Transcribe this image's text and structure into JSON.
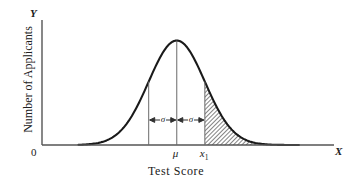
{
  "chart_data": {
    "type": "area",
    "title": "",
    "xlabel": "Test Score",
    "ylabel": "Number of Applicants",
    "x_axis_letter": "X",
    "y_axis_letter": "Y",
    "origin_label": "0",
    "grid": false,
    "legend": null,
    "distribution": "normal",
    "mu_label": "μ",
    "x1_label": "x",
    "x1_subscript": "1",
    "sigma_label": "σ",
    "annotations": [
      {
        "text": "σ",
        "from": "μ-σ",
        "to": "μ",
        "style": "double-headed-arrow"
      },
      {
        "text": "σ",
        "from": "μ",
        "to": "μ+σ",
        "style": "double-headed-arrow"
      }
    ],
    "vertical_lines": [
      {
        "name": "mu-minus-sigma",
        "x": -1.0
      },
      {
        "name": "mu",
        "x": 0.0
      },
      {
        "name": "mu-plus-sigma",
        "x": 1.0
      }
    ],
    "shaded_region": {
      "name": "right-tail",
      "from": 1.0,
      "to": 4.3,
      "fill": "hatch",
      "description": "shaded tail area to the right of x1"
    },
    "x": [
      -4.3,
      -4.0,
      -3.7,
      -3.4,
      -3.1,
      -2.8,
      -2.5,
      -2.2,
      -1.9,
      -1.6,
      -1.3,
      -1.0,
      -0.7,
      -0.4,
      -0.1,
      0.0,
      0.1,
      0.4,
      0.7,
      1.0,
      1.3,
      1.6,
      1.9,
      2.2,
      2.5,
      2.8,
      3.1,
      3.4,
      3.7,
      4.0,
      4.3
    ],
    "y": [
      0.0002,
      0.0013,
      0.0042,
      0.0123,
      0.0327,
      0.079,
      0.1736,
      0.3456,
      0.6248,
      1.0258,
      1.5313,
      2.0762,
      2.5586,
      2.8625,
      2.9554,
      2.9589,
      2.9554,
      2.8625,
      2.5586,
      2.0762,
      1.5313,
      1.0258,
      0.6248,
      0.3456,
      0.1736,
      0.079,
      0.0327,
      0.0123,
      0.0042,
      0.0013,
      0.0002
    ],
    "ylim": [
      0,
      3.2
    ],
    "xlim": [
      -4.8,
      5.6
    ],
    "colors": {
      "curve": "#1a1a1a",
      "axis": "#4a4a4a",
      "guide_line": "#6a6a6a",
      "shading": "#808080",
      "background": "#ffffff",
      "text": "#202020"
    }
  }
}
